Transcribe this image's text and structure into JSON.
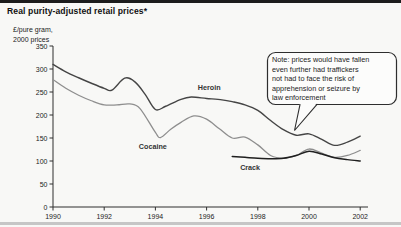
{
  "header": {
    "title": "Real purity-adjusted retail prices*",
    "unit_line1": "£/pure gram,",
    "unit_line2": "2000 prices"
  },
  "chart_data": {
    "type": "line",
    "title": "Real purity-adjusted retail prices*",
    "xlabel": "",
    "ylabel": "£/pure gram, 2000 prices",
    "xlim": [
      1990,
      2002.4
    ],
    "ylim": [
      0,
      350
    ],
    "x_ticks": [
      1990,
      1992,
      1994,
      1996,
      1998,
      2000,
      2002
    ],
    "y_ticks": [
      0,
      50,
      100,
      150,
      200,
      250,
      300,
      350
    ],
    "grid": false,
    "legend_position": "inline-labels",
    "annotation": {
      "lines": [
        "Note: prices would have fallen",
        "even further had traffickers",
        "not had to face the risk of",
        "apprehension or seizure by",
        "law enforcement"
      ],
      "points_to": "Heroin line near 1999"
    },
    "series": [
      {
        "name": "Heroin",
        "color": "#454545",
        "width": 1.4,
        "label_pos": [
          1996.1,
          254
        ],
        "points": [
          [
            1990,
            310
          ],
          [
            1990.5,
            294
          ],
          [
            1991,
            281
          ],
          [
            1991.5,
            269
          ],
          [
            1992,
            258
          ],
          [
            1992.3,
            254
          ],
          [
            1992.8,
            280
          ],
          [
            1993.2,
            272
          ],
          [
            1993.6,
            245
          ],
          [
            1994,
            212
          ],
          [
            1994.4,
            219
          ],
          [
            1995,
            234
          ],
          [
            1995.4,
            239
          ],
          [
            1996,
            236
          ],
          [
            1996.6,
            233
          ],
          [
            1997,
            229
          ],
          [
            1997.5,
            222
          ],
          [
            1998,
            210
          ],
          [
            1998.5,
            188
          ],
          [
            1999,
            168
          ],
          [
            1999.5,
            156
          ],
          [
            2000,
            159
          ],
          [
            2000.5,
            147
          ],
          [
            2001,
            134
          ],
          [
            2001.5,
            141
          ],
          [
            2002,
            154
          ]
        ]
      },
      {
        "name": "Cocaine",
        "color": "#8e8e8e",
        "width": 1.3,
        "label_pos": [
          1993.9,
          126
        ],
        "points": [
          [
            1990,
            277
          ],
          [
            1990.5,
            258
          ],
          [
            1991,
            243
          ],
          [
            1991.5,
            231
          ],
          [
            1992,
            222
          ],
          [
            1992.5,
            222
          ],
          [
            1993,
            224
          ],
          [
            1993.4,
            214
          ],
          [
            1994,
            162
          ],
          [
            1994.2,
            151
          ],
          [
            1994.6,
            169
          ],
          [
            1995,
            184
          ],
          [
            1995.5,
            198
          ],
          [
            1996,
            191
          ],
          [
            1996.5,
            170
          ],
          [
            1997,
            150
          ],
          [
            1997.5,
            152
          ],
          [
            1998,
            135
          ],
          [
            1998.5,
            112
          ],
          [
            1999,
            106
          ],
          [
            1999.5,
            112
          ],
          [
            2000,
            126
          ],
          [
            2000.5,
            117
          ],
          [
            2001,
            108
          ],
          [
            2001.5,
            112
          ],
          [
            2002,
            123
          ]
        ]
      },
      {
        "name": "Crack",
        "color": "#1f1f1f",
        "width": 1.5,
        "label_pos": [
          1997.7,
          80
        ],
        "points": [
          [
            1997,
            110
          ],
          [
            1997.5,
            108
          ],
          [
            1998,
            106
          ],
          [
            1998.5,
            105
          ],
          [
            1999,
            106
          ],
          [
            1999.5,
            112
          ],
          [
            2000,
            121
          ],
          [
            2000.5,
            115
          ],
          [
            2001,
            107
          ],
          [
            2001.5,
            103
          ],
          [
            2002,
            100
          ]
        ]
      }
    ],
    "colors": {
      "axis": "#2f2f2f",
      "tick_text": "#1c1c1c",
      "series_label_text": "#333333",
      "callout_border": "#2e2e2e",
      "callout_fill": "#fcfcfb",
      "rule_top": "#1c1c1c",
      "rule_bottom": "#c6c6c6"
    }
  }
}
